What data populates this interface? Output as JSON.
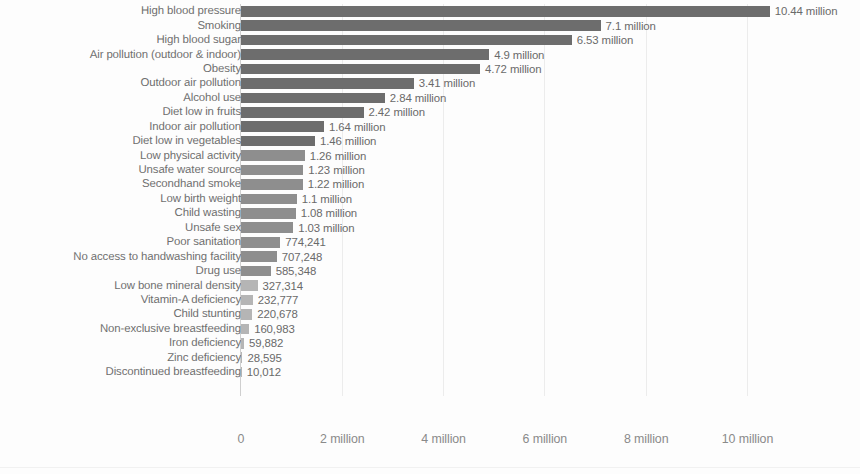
{
  "chart_data": {
    "type": "bar",
    "orientation": "horizontal",
    "title": "",
    "xlabel": "",
    "ylabel": "",
    "xlim": [
      0,
      11.2
    ],
    "grid": true,
    "legend": "none",
    "unit": "deaths",
    "xticks": [
      "0",
      "2 million",
      "4 million",
      "6 million",
      "8 million",
      "10 million"
    ],
    "xtick_values": [
      0,
      2000000,
      4000000,
      6000000,
      8000000,
      10000000
    ],
    "categories": [
      "High blood pressure",
      "Smoking",
      "High blood sugar",
      "Air pollution (outdoor & indoor)",
      "Obesity",
      "Outdoor air pollution",
      "Alcohol use",
      "Diet low in fruits",
      "Indoor air pollution",
      "Diet low in vegetables",
      "Low physical activity",
      "Unsafe water source",
      "Secondhand smoke",
      "Low birth weight",
      "Child wasting",
      "Unsafe sex",
      "Poor sanitation",
      "No access to handwashing facility",
      "Drug use",
      "Low bone mineral density",
      "Vitamin-A deficiency",
      "Child stunting",
      "Non-exclusive breastfeeding",
      "Iron deficiency",
      "Zinc deficiency",
      "Discontinued breastfeeding"
    ],
    "values": [
      10440000,
      7100000,
      6530000,
      4900000,
      4720000,
      3410000,
      2840000,
      2420000,
      1640000,
      1460000,
      1260000,
      1230000,
      1220000,
      1100000,
      1080000,
      1030000,
      774241,
      707248,
      585348,
      327314,
      232777,
      220678,
      160983,
      59882,
      28595,
      10012
    ],
    "value_labels": [
      "10.44 million",
      "7.1 million",
      "6.53 million",
      "4.9 million",
      "4.72 million",
      "3.41 million",
      "2.84 million",
      "2.42 million",
      "1.64 million",
      "1.46 million",
      "1.26 million",
      "1.23 million",
      "1.22 million",
      "1.1 million",
      "1.08 million",
      "1.03 million",
      "774,241",
      "707,248",
      "585,348",
      "327,314",
      "232,777",
      "220,678",
      "160,983",
      "59,882",
      "28,595",
      "10,012"
    ]
  },
  "style": {
    "bar_color": "#6d6d6d",
    "bar_color_light": "#8e8e8e",
    "bar_color_lighter": "#b5b5b5",
    "label_color": "#6f6f6f",
    "axis_color": "#cfcfcf",
    "grid_color": "#ececec",
    "background": "#fdfdfd"
  }
}
